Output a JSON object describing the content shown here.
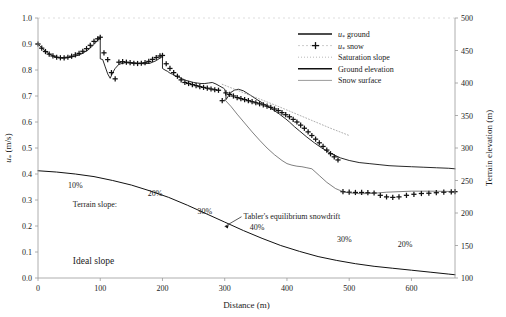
{
  "chart_data": {
    "type": "line",
    "title": "",
    "xlabel": "Distance (m)",
    "ylabel": "u* (m/s)",
    "y2label": "Terrain elevation (m)",
    "xlim": [
      0,
      670
    ],
    "ylim": [
      0.0,
      1.0
    ],
    "y2lim": [
      100,
      500
    ],
    "grid": false,
    "legend_position": "top-right",
    "xticks": [
      0,
      100,
      200,
      300,
      400,
      500,
      600
    ],
    "xtick_labels": [
      "0",
      "100",
      "200",
      "300",
      "400",
      "500",
      "600"
    ],
    "yticks": [
      0.0,
      0.1,
      0.2,
      0.3,
      0.4,
      0.5,
      0.6,
      0.7,
      0.8,
      0.9,
      1.0
    ],
    "ytick_labels": [
      "0.0",
      "0.1",
      "0.2",
      "0.3",
      "0.4",
      "0.5",
      "0.6",
      "0.7",
      "0.8",
      "0.9",
      "1.0"
    ],
    "y2ticks": [
      100,
      150,
      200,
      250,
      300,
      350,
      400,
      450,
      500
    ],
    "y2tick_labels": [
      "100",
      "150",
      "200",
      "250",
      "300",
      "350",
      "400",
      "450",
      "500"
    ],
    "legend": [
      {
        "label": "u* ground",
        "style": "solid-thick",
        "color": "#111111"
      },
      {
        "label": "u* snow",
        "style": "plus-marker",
        "color": "#111111"
      },
      {
        "label": "Saturation slope",
        "style": "dotted",
        "color": "#8a8a8a"
      },
      {
        "label": "Ground elevation",
        "style": "solid-thick",
        "color": "#111111"
      },
      {
        "label": "Snow surface",
        "style": "thin-dash",
        "color": "#555555"
      }
    ],
    "series": [
      {
        "name": "u* ground",
        "axis": "left",
        "x": [
          0,
          8,
          16,
          24,
          32,
          40,
          50,
          60,
          70,
          80,
          90,
          96,
          100,
          100,
          104,
          108,
          112,
          116,
          120,
          124,
          130,
          140,
          150,
          160,
          170,
          180,
          190,
          196,
          200,
          200,
          204,
          208,
          212,
          216,
          220,
          226,
          232,
          238,
          244,
          250,
          256,
          262,
          268,
          274,
          280,
          286,
          292,
          298,
          300,
          302,
          302,
          306,
          310,
          316,
          322,
          330,
          340,
          352,
          364,
          376,
          388,
          398,
          404,
          412,
          420,
          432,
          444,
          456,
          470,
          486,
          500,
          516,
          532,
          548,
          564,
          580,
          600,
          620,
          640,
          660,
          670
        ],
        "y": [
          0.9,
          0.88,
          0.865,
          0.854,
          0.848,
          0.846,
          0.848,
          0.853,
          0.862,
          0.876,
          0.898,
          0.915,
          0.925,
          0.843,
          0.84,
          0.812,
          0.785,
          0.768,
          0.79,
          0.806,
          0.822,
          0.828,
          0.828,
          0.826,
          0.824,
          0.826,
          0.836,
          0.846,
          0.852,
          0.806,
          0.8,
          0.795,
          0.788,
          0.784,
          0.778,
          0.772,
          0.766,
          0.76,
          0.756,
          0.752,
          0.75,
          0.748,
          0.748,
          0.75,
          0.752,
          0.746,
          0.738,
          0.73,
          0.726,
          0.7,
          0.686,
          0.7,
          0.714,
          0.723,
          0.726,
          0.72,
          0.705,
          0.686,
          0.668,
          0.65,
          0.63,
          0.612,
          0.6,
          0.582,
          0.566,
          0.542,
          0.52,
          0.5,
          0.48,
          0.462,
          0.452,
          0.444,
          0.44,
          0.436,
          0.432,
          0.43,
          0.428,
          0.426,
          0.424,
          0.422,
          0.42
        ]
      },
      {
        "name": "u* snow",
        "axis": "left",
        "x": [
          0,
          6,
          12,
          18,
          24,
          30,
          36,
          42,
          48,
          54,
          60,
          66,
          72,
          78,
          84,
          90,
          96,
          100,
          106,
          112,
          118,
          124,
          130,
          136,
          142,
          148,
          154,
          160,
          166,
          172,
          178,
          184,
          190,
          196,
          200,
          206,
          212,
          218,
          224,
          230,
          236,
          242,
          248,
          254,
          260,
          266,
          272,
          278,
          284,
          290,
          296,
          302,
          308,
          314,
          320,
          326,
          332,
          338,
          344,
          350,
          356,
          362,
          368,
          374,
          380,
          386,
          392,
          398,
          404,
          410,
          416,
          422,
          428,
          434,
          440,
          446,
          452,
          458,
          464,
          470,
          476,
          482,
          490,
          500,
          510,
          520,
          530,
          540,
          550,
          560,
          570,
          580,
          592,
          604,
          616,
          628,
          640,
          652,
          664,
          670
        ],
        "y": [
          0.9,
          0.884,
          0.871,
          0.861,
          0.854,
          0.849,
          0.847,
          0.847,
          0.849,
          0.853,
          0.858,
          0.864,
          0.872,
          0.882,
          0.895,
          0.91,
          0.92,
          0.926,
          0.866,
          0.84,
          0.79,
          0.766,
          0.83,
          0.832,
          0.83,
          0.828,
          0.826,
          0.825,
          0.826,
          0.828,
          0.833,
          0.841,
          0.848,
          0.854,
          0.856,
          0.824,
          0.806,
          0.79,
          0.776,
          0.762,
          0.752,
          0.748,
          0.744,
          0.74,
          0.736,
          0.733,
          0.73,
          0.727,
          0.724,
          0.722,
          0.682,
          0.712,
          0.706,
          0.7,
          0.694,
          0.69,
          0.686,
          0.682,
          0.678,
          0.674,
          0.67,
          0.666,
          0.661,
          0.656,
          0.65,
          0.644,
          0.636,
          0.628,
          0.62,
          0.61,
          0.6,
          0.588,
          0.576,
          0.562,
          0.548,
          0.534,
          0.52,
          0.506,
          0.492,
          0.478,
          0.466,
          0.454,
          0.332,
          0.33,
          0.329,
          0.329,
          0.328,
          0.327,
          0.318,
          0.312,
          0.31,
          0.312,
          0.318,
          0.322,
          0.325,
          0.326,
          0.328,
          0.33,
          0.331,
          0.332
        ]
      },
      {
        "name": "Saturation slope",
        "axis": "left",
        "x": [
          296,
          320,
          350,
          380,
          410,
          440,
          470,
          500
        ],
        "y": [
          0.745,
          0.722,
          0.694,
          0.666,
          0.636,
          0.606,
          0.576,
          0.548
        ]
      },
      {
        "name": "Ground elevation",
        "axis": "right",
        "x": [
          0,
          30,
          60,
          90,
          120,
          150,
          180,
          210,
          240,
          270,
          300,
          330,
          360,
          390,
          420,
          450,
          480,
          510,
          540,
          570,
          600,
          630,
          660,
          670
        ],
        "y": [
          265,
          263,
          260,
          256,
          250,
          243,
          234,
          224,
          212,
          199,
          186,
          173,
          161,
          150,
          141,
          133,
          127,
          122,
          118,
          115,
          112,
          109,
          106,
          105
        ]
      },
      {
        "name": "Snow surface",
        "axis": "left",
        "x": [
          300,
          310,
          320,
          332,
          344,
          356,
          368,
          380,
          392,
          400,
          408,
          416,
          424,
          432,
          440,
          452,
          464,
          478,
          492,
          506,
          520,
          540,
          560,
          580,
          600,
          630,
          660,
          670
        ],
        "y": [
          0.686,
          0.66,
          0.63,
          0.596,
          0.562,
          0.53,
          0.5,
          0.474,
          0.452,
          0.44,
          0.434,
          0.43,
          0.428,
          0.424,
          0.42,
          0.394,
          0.368,
          0.344,
          0.33,
          0.326,
          0.324,
          0.326,
          0.33,
          0.332,
          0.334,
          0.334,
          0.333,
          0.332
        ]
      }
    ],
    "annotations": [
      {
        "text": "10%",
        "x": 60,
        "y": 0.345
      },
      {
        "text": "20%",
        "x": 188,
        "y": 0.315
      },
      {
        "text": "30%",
        "x": 268,
        "y": 0.245
      },
      {
        "text": "40%",
        "x": 352,
        "y": 0.185
      },
      {
        "text": "30%",
        "x": 492,
        "y": 0.14
      },
      {
        "text": "20%",
        "x": 590,
        "y": 0.118
      },
      {
        "text": "Terrain slope:",
        "x": 56,
        "y": 0.275
      },
      {
        "text": "Ideal slope",
        "x": 56,
        "y": 0.055
      },
      {
        "text": "Tabler's equilibrium snowdrift",
        "x": 390,
        "y": 0.228
      }
    ]
  }
}
